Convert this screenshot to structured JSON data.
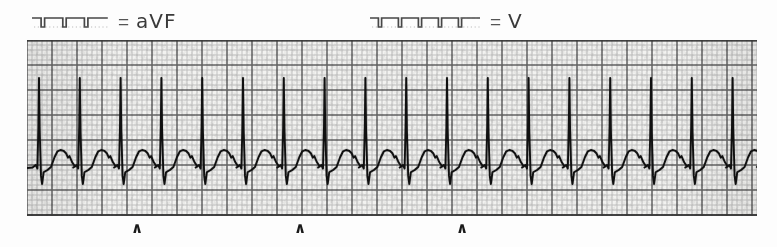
{
  "header": {
    "leads": [
      {
        "name": "lead-avf",
        "equals": "=",
        "label": "aVF",
        "x": 32,
        "marker_width": 78,
        "marker": "square-wave-calibration-marker",
        "marker_steps": 3,
        "marker_faded_tail": false
      },
      {
        "name": "lead-v",
        "equals": "=",
        "label": "V",
        "x": 370,
        "marker_width": 112,
        "marker": "square-wave-calibration-marker",
        "marker_steps": 5,
        "marker_faded_tail": true
      }
    ]
  },
  "strip": {
    "name": "ecg-rhythm-strip",
    "left": 27,
    "top": 40,
    "width": 730,
    "height": 176,
    "grid": {
      "small_square_px": 5,
      "major_every": 5,
      "minor_color": "#8f8f8f",
      "major_color": "#4a4a4a",
      "paper_color": "#f2f2f0"
    },
    "trace": {
      "color": "#101010",
      "baseline_y": 126,
      "beat_spacing_px": 40.8,
      "first_beat_x": 12,
      "beat_count": 18,
      "r_peak_height": 88,
      "s_depth": 18,
      "t_wave_height": 16,
      "description": "regular narrow-complex tachycardia, tall R spikes with broad rounded T waves"
    }
  },
  "markers": {
    "name": "caret-annotation",
    "glyph": "∧",
    "positions": [
      137,
      300,
      462
    ]
  },
  "chart_data": {
    "type": "line",
    "title": "",
    "xlabel": "",
    "ylabel": "",
    "grid": true,
    "legend": [
      "aVF",
      "V"
    ],
    "legend_position": "top",
    "annotations": [
      {
        "label": "∧",
        "x": 137
      },
      {
        "label": "∧",
        "x": 300
      },
      {
        "label": "∧",
        "x": 462
      }
    ],
    "series": [
      {
        "name": "ECG rhythm strip",
        "beat_count": 18,
        "beat_spacing_px": 40.8,
        "r_peak_xs": [
          39,
          80,
          121,
          161,
          202,
          243,
          284,
          325,
          366,
          406,
          447,
          488,
          529,
          570,
          611,
          651,
          692,
          733
        ]
      }
    ]
  }
}
